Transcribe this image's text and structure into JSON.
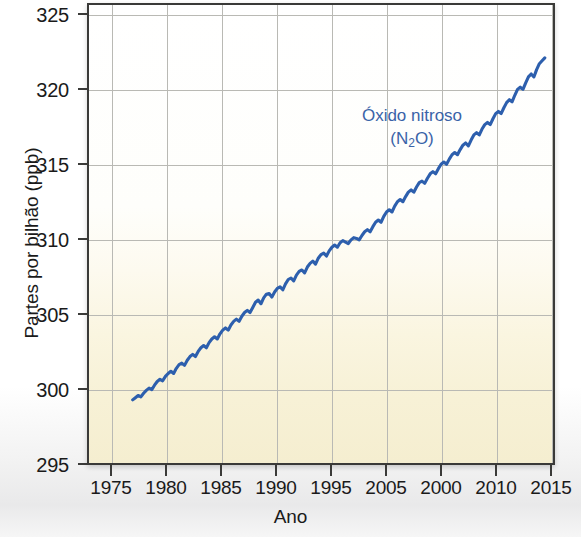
{
  "chart_data": {
    "type": "line",
    "title": "",
    "xlabel": "Ano",
    "ylabel": "Partes por bilhão (ppb)",
    "annotation_line1": "Óxido nitroso",
    "annotation_line2_pre": "(N",
    "annotation_line2_sub": "2",
    "annotation_line2_post": "O)",
    "series_name": "Óxido nitroso (N2O)",
    "line_color": "#2d5fad",
    "annotation_color": "#3a63a8",
    "grid": true,
    "legend_position": "inside-annotation",
    "xlim": [
      1972.5,
      2015.0
    ],
    "ylim": [
      295,
      326.2
    ],
    "ytick_labels": [
      "325",
      "320",
      "315",
      "310",
      "305",
      "300",
      "295"
    ],
    "yticks": [
      325,
      320,
      315,
      310,
      305,
      300,
      295
    ],
    "xtick_labels": [
      "1975",
      "1980",
      "1985",
      "1990",
      "1995",
      "2005",
      "2000",
      "2010",
      "2015"
    ],
    "xticks": [
      1975,
      1980,
      1985,
      1990,
      1995,
      2000,
      2005,
      2010,
      2015
    ],
    "x": [
      1976.5,
      1976.75,
      1977.0,
      1977.25,
      1977.5,
      1977.75,
      1978.0,
      1978.25,
      1978.5,
      1978.75,
      1979.0,
      1979.25,
      1979.5,
      1979.75,
      1980.0,
      1980.25,
      1980.5,
      1980.75,
      1981.0,
      1981.25,
      1981.5,
      1981.75,
      1982.0,
      1982.25,
      1982.5,
      1982.75,
      1983.0,
      1983.25,
      1983.5,
      1983.75,
      1984.0,
      1984.25,
      1984.5,
      1984.75,
      1985.0,
      1985.25,
      1985.5,
      1985.75,
      1986.0,
      1986.25,
      1986.5,
      1986.75,
      1987.0,
      1987.25,
      1987.5,
      1987.75,
      1988.0,
      1988.25,
      1988.5,
      1988.75,
      1989.0,
      1989.25,
      1989.5,
      1989.75,
      1990.0,
      1990.25,
      1990.5,
      1990.75,
      1991.0,
      1991.25,
      1991.5,
      1991.75,
      1992.0,
      1992.25,
      1992.5,
      1992.75,
      1993.0,
      1993.25,
      1993.5,
      1993.75,
      1994.0,
      1994.25,
      1994.5,
      1994.75,
      1995.0,
      1995.25,
      1995.5,
      1995.75,
      1996.0,
      1996.25,
      1996.5,
      1996.75,
      1997.0,
      1997.25,
      1997.5,
      1997.75,
      1998.0,
      1998.25,
      1998.5,
      1998.75,
      1999.0,
      1999.25,
      1999.5,
      1999.75,
      2000.0,
      2000.25,
      2000.5,
      2000.75,
      2001.0,
      2001.25,
      2001.5,
      2001.75,
      2002.0,
      2002.25,
      2002.5,
      2002.75,
      2003.0,
      2003.25,
      2003.5,
      2003.75,
      2004.0,
      2004.25,
      2004.5,
      2004.75,
      2005.0,
      2005.25,
      2005.5,
      2005.75,
      2006.0,
      2006.25,
      2006.5,
      2006.75,
      2007.0,
      2007.25,
      2007.5,
      2007.75,
      2008.0,
      2008.25,
      2008.5,
      2008.75,
      2009.0,
      2009.25,
      2009.5,
      2009.75,
      2010.0,
      2010.25,
      2010.5,
      2010.75,
      2011.0,
      2011.25,
      2011.5,
      2011.75,
      2012.0,
      2012.25,
      2012.5,
      2012.75,
      2013.0,
      2013.25,
      2013.5,
      2013.75,
      2014.0,
      2014.25
    ],
    "y": [
      299.3,
      299.45,
      299.6,
      299.5,
      299.75,
      299.95,
      300.1,
      300.0,
      300.3,
      300.55,
      300.7,
      300.6,
      300.9,
      301.1,
      301.25,
      301.1,
      301.45,
      301.7,
      301.8,
      301.65,
      302.0,
      302.25,
      302.4,
      302.25,
      302.6,
      302.85,
      303.0,
      302.85,
      303.2,
      303.45,
      303.6,
      303.45,
      303.8,
      304.05,
      304.2,
      304.05,
      304.4,
      304.65,
      304.8,
      304.65,
      305.0,
      305.25,
      305.4,
      305.25,
      305.6,
      305.95,
      306.1,
      305.85,
      306.25,
      306.5,
      306.55,
      306.3,
      306.65,
      306.9,
      307.0,
      306.8,
      307.2,
      307.5,
      307.6,
      307.4,
      307.8,
      308.05,
      308.15,
      307.95,
      308.35,
      308.6,
      308.75,
      308.55,
      308.95,
      309.2,
      309.3,
      309.1,
      309.45,
      309.7,
      309.85,
      309.7,
      310.0,
      310.15,
      310.05,
      309.95,
      310.2,
      310.35,
      310.3,
      310.2,
      310.5,
      310.75,
      310.9,
      310.75,
      311.1,
      311.4,
      311.55,
      311.4,
      311.8,
      312.1,
      312.25,
      312.1,
      312.5,
      312.8,
      312.95,
      312.8,
      313.15,
      313.45,
      313.6,
      313.45,
      313.8,
      314.1,
      314.2,
      314.05,
      314.4,
      314.7,
      314.85,
      314.7,
      315.05,
      315.35,
      315.5,
      315.35,
      315.7,
      316.0,
      316.15,
      316.0,
      316.35,
      316.65,
      316.8,
      316.6,
      317.0,
      317.35,
      317.5,
      317.35,
      317.75,
      318.05,
      318.2,
      318.05,
      318.45,
      318.8,
      318.95,
      318.8,
      319.2,
      319.55,
      319.75,
      319.6,
      320.05,
      320.45,
      320.6,
      320.45,
      320.9,
      321.3,
      321.5,
      321.3,
      321.8,
      322.2,
      322.4,
      322.6
    ]
  }
}
